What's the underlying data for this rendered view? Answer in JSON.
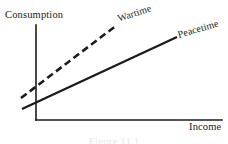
{
  "figure": {
    "background_color": "#ffffff",
    "ink_color": "#1c1c1c",
    "caption": "Figure 11.1"
  },
  "axes": {
    "y_title": "Consumption",
    "x_title": "Income",
    "origin": {
      "x": 36,
      "y": 120
    },
    "y_axis_top": {
      "x": 36,
      "y": 25
    },
    "x_axis_right": {
      "x": 222,
      "y": 120
    },
    "line_color": "#1c1c1c",
    "line_width": 1.6
  },
  "curves": [
    {
      "name": "wartime",
      "label": "Wartime",
      "style": "dashed",
      "dash_pattern": "7 4",
      "color": "#1c1c1c",
      "width": 2.6,
      "start": {
        "x": 21,
        "y": 98
      },
      "end": {
        "x": 117,
        "y": 25
      },
      "label_rotation_deg": -18.5,
      "label_position": {
        "x": 118,
        "y": 14
      }
    },
    {
      "name": "peacetime",
      "label": "Peacetime",
      "style": "solid",
      "color": "#1c1c1c",
      "width": 2.4,
      "start": {
        "x": 22,
        "y": 109
      },
      "end": {
        "x": 177,
        "y": 37
      },
      "label_rotation_deg": -16,
      "label_position": {
        "x": 178,
        "y": 30
      }
    }
  ],
  "chart_data": {
    "type": "line",
    "title": "",
    "subtitle": "",
    "xlabel": "Income",
    "ylabel": "Consumption",
    "xlim": [
      0,
      1
    ],
    "ylim": [
      0,
      1
    ],
    "grid": false,
    "axis_ticks": [],
    "legend": "inline-labels",
    "legend_position": "at curve ends",
    "annotations": [
      "Wartime",
      "Peacetime"
    ],
    "series": [
      {
        "name": "Wartime",
        "style": "dashed",
        "description": "Higher-intercept, steeper consumption function lying above the peacetime line over most of the income range",
        "x": [
          0.0,
          0.25,
          0.5,
          0.75,
          1.0
        ],
        "y": [
          0.23,
          0.42,
          0.61,
          0.8,
          1.0
        ]
      },
      {
        "name": "Peacetime",
        "style": "solid",
        "description": "Lower-intercept, flatter consumption function crossing the wartime line near the vertical axis",
        "x": [
          0.0,
          0.25,
          0.5,
          0.75,
          1.0
        ],
        "y": [
          0.12,
          0.27,
          0.43,
          0.58,
          0.74
        ]
      }
    ]
  }
}
